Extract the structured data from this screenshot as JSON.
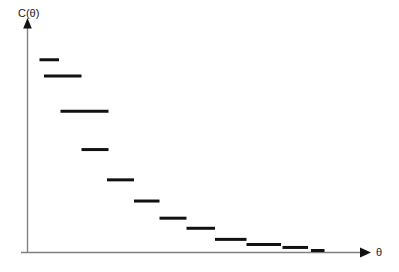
{
  "chart_data": {
    "type": "line",
    "title": "",
    "subtitle": "",
    "xlabel": "θ",
    "ylabel": "C(θ)",
    "grid": false,
    "legend": null,
    "style": "step",
    "xlim": [
      0,
      11
    ],
    "ylim": [
      0,
      11
    ],
    "axis_color": "#808080",
    "series_color": "#111111",
    "series": [
      {
        "name": "C(θ)",
        "steps": [
          {
            "index": 1,
            "x_start": 0.4,
            "x_end": 1.05,
            "value": 9.55
          },
          {
            "index": 2,
            "x_start": 0.55,
            "x_end": 1.8,
            "value": 8.75
          },
          {
            "index": 3,
            "x_start": 1.1,
            "x_end": 2.7,
            "value": 7.0
          },
          {
            "index": 4,
            "x_start": 1.8,
            "x_end": 2.7,
            "value": 5.1
          },
          {
            "index": 5,
            "x_start": 2.65,
            "x_end": 3.55,
            "value": 3.6
          },
          {
            "index": 6,
            "x_start": 3.55,
            "x_end": 4.4,
            "value": 2.55
          },
          {
            "index": 7,
            "x_start": 4.4,
            "x_end": 5.3,
            "value": 1.7
          },
          {
            "index": 8,
            "x_start": 5.3,
            "x_end": 6.25,
            "value": 1.2
          },
          {
            "index": 9,
            "x_start": 6.25,
            "x_end": 7.3,
            "value": 0.65
          },
          {
            "index": 10,
            "x_start": 7.3,
            "x_end": 8.45,
            "value": 0.4
          },
          {
            "index": 11,
            "x_start": 8.5,
            "x_end": 9.35,
            "value": 0.25
          },
          {
            "index": 12,
            "x_start": 9.45,
            "x_end": 9.9,
            "value": 0.1
          }
        ]
      }
    ]
  },
  "axes": {
    "y_axis_name": "y-axis",
    "x_axis_name": "x-axis",
    "y_label": "C(θ)",
    "x_label": "θ"
  }
}
